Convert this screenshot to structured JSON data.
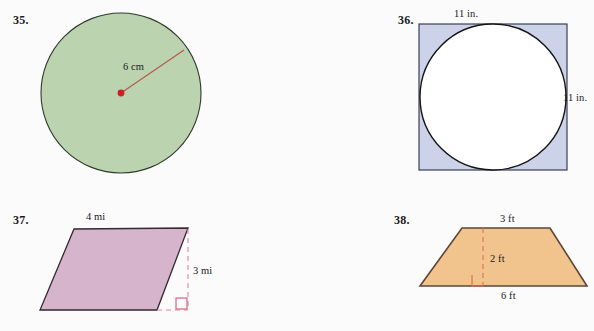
{
  "page": {
    "background_color": "#fbfbfc",
    "width": 594,
    "height": 331
  },
  "problems": [
    {
      "number": "35.",
      "shape": "circle",
      "fill_color": "#bcd3b0",
      "stroke_color": "#2f3b2c",
      "accent_color": "#c0392b",
      "labels": [
        {
          "text": "6 cm",
          "role": "radius"
        }
      ]
    },
    {
      "number": "36.",
      "shape": "square-with-inscribed-circle",
      "fill_color": "#ccd3e8",
      "stroke_color": "#3a3f55",
      "circle_fill_color": "#ffffff",
      "circle_stroke_color": "#111111",
      "labels": [
        {
          "text": "11 in.",
          "role": "top-side"
        },
        {
          "text": "11 in.",
          "role": "right-side"
        }
      ]
    },
    {
      "number": "37.",
      "shape": "parallelogram",
      "fill_color": "#d6b4cc",
      "stroke_color": "#33292f",
      "accent_color": "#e08598",
      "labels": [
        {
          "text": "4 mi",
          "role": "base"
        },
        {
          "text": "3 mi",
          "role": "height"
        }
      ]
    },
    {
      "number": "38.",
      "shape": "trapezoid",
      "fill_color": "#f2c48d",
      "stroke_color": "#5c4636",
      "accent_color": "#e0714e",
      "labels": [
        {
          "text": "3 ft",
          "role": "top-base"
        },
        {
          "text": "2 ft",
          "role": "height"
        },
        {
          "text": "6 ft",
          "role": "bottom-base"
        }
      ]
    }
  ]
}
